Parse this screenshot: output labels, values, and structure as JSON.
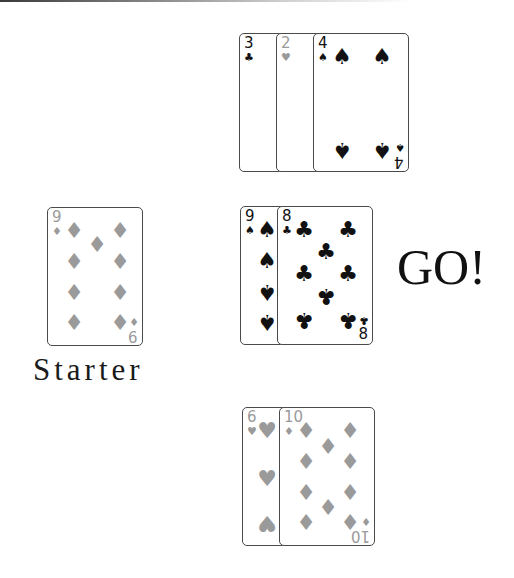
{
  "table": {
    "colors": {
      "black_suit": "#111111",
      "diamond_heart_suit": "#9a9a9a",
      "card_border": "#4a4a4a",
      "background": "#ffffff"
    },
    "starter": {
      "label": "Starter",
      "card": {
        "rank": "9",
        "suit": "♦",
        "color": "gray"
      }
    },
    "status_message": "GO!",
    "top_pile": [
      {
        "rank": "3",
        "suit": "♣",
        "color": "black"
      },
      {
        "rank": "2",
        "suit": "♥",
        "color": "gray"
      },
      {
        "rank": "4",
        "suit": "♠",
        "color": "black"
      }
    ],
    "middle_pile": [
      {
        "rank": "9",
        "suit": "♠",
        "color": "black"
      },
      {
        "rank": "8",
        "suit": "♣",
        "color": "black"
      }
    ],
    "bottom_pile": [
      {
        "rank": "6",
        "suit": "♥",
        "color": "gray"
      },
      {
        "rank": "10",
        "suit": "♦",
        "color": "gray"
      }
    ],
    "bottom_text": ""
  }
}
